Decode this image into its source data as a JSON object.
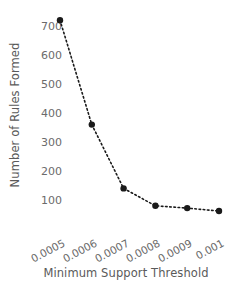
{
  "chart_data": {
    "type": "line",
    "title": "",
    "xlabel": "Minimum Support Threshold",
    "ylabel": "Number of Rules Formed",
    "categories": [
      "0.0005",
      "0.0006",
      "0.0007",
      "0.0008",
      "0.0009",
      "0.001"
    ],
    "x": [
      0.0005,
      0.0006,
      0.0007,
      0.0008,
      0.0009,
      0.001
    ],
    "values": [
      720,
      360,
      140,
      80,
      72,
      62
    ],
    "series": [
      {
        "name": "Number of Rules Formed",
        "values": [
          720,
          360,
          140,
          80,
          72,
          62
        ]
      }
    ],
    "ytick_labels": [
      "700",
      "600",
      "500",
      "400",
      "300",
      "200",
      "100"
    ],
    "yticks": [
      700,
      600,
      500,
      400,
      300,
      200,
      100
    ],
    "ylim": [
      0,
      760
    ],
    "xlim": [
      0.00045,
      0.00105
    ],
    "grid": false,
    "legend": false,
    "legend_position": "none",
    "marker": "circle",
    "linestyle": "dotted",
    "marker_color": "#1a1a1a",
    "line_color": "#1a1a1a",
    "text_color": "#6b6b6b",
    "background": "#ffffff"
  },
  "axes": {
    "y_title": "Number of Rules Formed",
    "x_title": "Minimum Support Threshold"
  }
}
